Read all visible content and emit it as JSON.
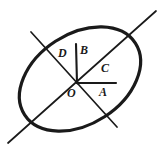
{
  "figure": {
    "type": "geometry-diagram",
    "caption": "",
    "stroke_color": "#1a1a1a",
    "background_color": "#ffffff",
    "labels": {
      "A": "A",
      "B": "B",
      "C": "C",
      "D": "D",
      "O": "O"
    },
    "geometry": {
      "ellipse": {
        "cx": 80,
        "cy": 79,
        "rx": 66,
        "ry": 45,
        "rotation_deg": -33,
        "stroke_width": 3
      },
      "origin": {
        "x": 78,
        "y": 83
      },
      "rays": [
        {
          "name": "A",
          "from": [
            78,
            83
          ],
          "to": [
            116,
            83
          ],
          "kind": "horizontal-right",
          "stroke_width": 2
        },
        {
          "name": "B",
          "from": [
            78,
            83
          ],
          "to": [
            76,
            44
          ],
          "kind": "vertical-up",
          "stroke_width": 2
        },
        {
          "name": "C",
          "from": [
            78,
            83
          ],
          "to": [
            155,
            12
          ],
          "kind": "diagonal-up-right-extended",
          "stroke_width": 1.6
        },
        {
          "name": "C-opposite",
          "from": [
            78,
            83
          ],
          "to": [
            8,
            143
          ],
          "kind": "diagonal-down-left-extended",
          "stroke_width": 1.6
        },
        {
          "name": "D",
          "from": [
            78,
            83
          ],
          "to": [
            32,
            33
          ],
          "kind": "diagonal-up-left",
          "stroke_width": 1.6
        },
        {
          "name": "D-opposite",
          "from": [
            78,
            83
          ],
          "to": [
            116,
            126
          ],
          "kind": "diagonal-down-right",
          "stroke_width": 1.6
        }
      ]
    }
  }
}
